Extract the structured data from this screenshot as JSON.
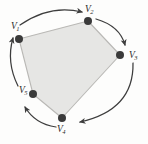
{
  "figure": {
    "type": "geometry-diagram",
    "background_color": "#fdfdfc",
    "polygon": {
      "name": "pentagon",
      "fill_color": "#e6e6e4",
      "stroke_color": "#b9b8b5",
      "stroke_width": 1.1,
      "points": "19,39 88,21 120,55 62,118 33,94"
    },
    "vertices": [
      {
        "id": "v1",
        "label": "V",
        "subscript": "1",
        "x": 19,
        "y": 39,
        "label_x": 11,
        "label_y": 22,
        "dot_r": 4.0
      },
      {
        "id": "v2",
        "label": "V",
        "subscript": "2",
        "x": 88,
        "y": 21,
        "label_x": 85,
        "label_y": 5,
        "dot_r": 4.0
      },
      {
        "id": "v3",
        "label": "V",
        "subscript": "3",
        "x": 120,
        "y": 55,
        "label_x": 129,
        "label_y": 51,
        "dot_r": 4.0
      },
      {
        "id": "v4",
        "label": "V",
        "subscript": "4",
        "x": 62,
        "y": 118,
        "label_x": 57,
        "label_y": 125,
        "dot_r": 4.0
      },
      {
        "id": "v5",
        "label": "V",
        "subscript": "5",
        "x": 33,
        "y": 94,
        "label_x": 19,
        "label_y": 86,
        "dot_r": 4.0
      }
    ],
    "vertex_dot_color": "#3a3a3a",
    "arrows": {
      "stroke_color": "#3d3d3d",
      "stroke_width": 1.25,
      "arcs": [
        {
          "id": "arc-v1-v2",
          "from": "v1",
          "to": "v2",
          "path": "M 20,25 Q 50,4 82,12"
        },
        {
          "id": "arc-v2-v3",
          "from": "v2",
          "to": "v3",
          "path": "M 96,19 Q 120,26 125,45"
        },
        {
          "id": "arc-v3-v4",
          "from": "v3",
          "to": "v4",
          "path": "M 133,63 Q 134,110 80,122"
        },
        {
          "id": "arc-v4-v5",
          "from": "v4",
          "to": "v5",
          "path": "M 56,127 Q 35,124 25,107"
        },
        {
          "id": "arc-v5-v1",
          "from": "v5",
          "to": "v1",
          "path": "M 18,86 Q 6,62 13,38"
        }
      ]
    }
  }
}
